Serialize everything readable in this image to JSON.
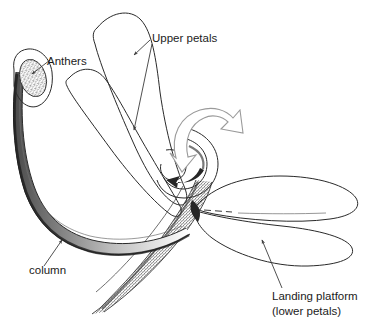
{
  "figure": {
    "kind": "botanical-line-diagram",
    "background_color": "#ffffff",
    "ink_color": "#2a2a2a",
    "rotation_arrow_color": "#9a9a9a"
  },
  "labels": [
    {
      "id": "upper-petals",
      "text": "Upper petals",
      "x": 152,
      "y": 42,
      "anchor": "start",
      "lines": [
        "Upper petals"
      ]
    },
    {
      "id": "anthers",
      "text": "Anthers",
      "x": 47,
      "y": 65,
      "anchor": "start",
      "lines": [
        "Anthers"
      ]
    },
    {
      "id": "column",
      "text": "column",
      "x": 29,
      "y": 274,
      "anchor": "start",
      "lines": [
        "column"
      ]
    },
    {
      "id": "landing-platform",
      "text": "Landing platform (lower petals)",
      "x": 272,
      "y": 300,
      "anchor": "start",
      "lines": [
        "Landing platform",
        "(lower petals)"
      ]
    }
  ],
  "parts": [
    {
      "id": "upper-petal-rear",
      "name": "upper petal (rear)"
    },
    {
      "id": "upper-petal-front",
      "name": "upper petal (front)"
    },
    {
      "id": "anther-sac",
      "name": "anther sac"
    },
    {
      "id": "column-band",
      "name": "column"
    },
    {
      "id": "hook-curl",
      "name": "column hook"
    },
    {
      "id": "lower-petal-upper",
      "name": "landing platform lobe (upper)"
    },
    {
      "id": "lower-petal-lower",
      "name": "landing platform lobe (lower)"
    },
    {
      "id": "flower-tube",
      "name": "flower tube / stem"
    },
    {
      "id": "rotation-arrow",
      "name": "rotation direction arrow"
    }
  ]
}
